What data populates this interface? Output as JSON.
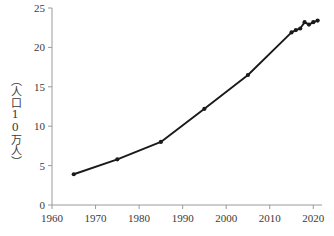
{
  "chart_data": {
    "type": "line",
    "title": "",
    "subtitle": "",
    "xlabel": "",
    "ylabel": "（人口10万人）",
    "xlim": [
      1960,
      2022
    ],
    "ylim": [
      0,
      25
    ],
    "xticks": [
      1960,
      1970,
      1980,
      1990,
      2000,
      2010,
      2020
    ],
    "yticks": [
      0,
      5,
      10,
      15,
      20,
      25
    ],
    "grid": false,
    "legend": null,
    "marker": "circle",
    "line_color": "#1a1a1a",
    "axis_color": "#9a9a9a",
    "series": [
      {
        "name": "人口10万人あたり",
        "x": [
          1965,
          1975,
          1985,
          1995,
          2005,
          2015,
          2016,
          2017,
          2018,
          2019,
          2020,
          2021
        ],
        "values": [
          3.9,
          5.8,
          8.0,
          12.2,
          16.5,
          21.9,
          22.2,
          22.4,
          23.2,
          22.9,
          23.2,
          23.4
        ]
      }
    ]
  },
  "axis_labels": {
    "x": [
      "1960",
      "1970",
      "1980",
      "1990",
      "2000",
      "2010",
      "2020"
    ],
    "y": [
      "0",
      "5",
      "10",
      "15",
      "20",
      "25"
    ]
  }
}
